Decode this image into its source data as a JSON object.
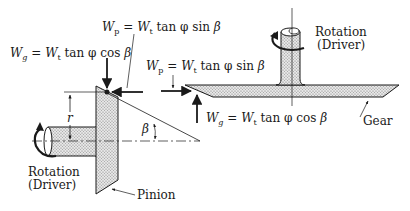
{
  "diagram": {
    "type": "bevel-gear-force-diagram",
    "labels": {
      "wg_left": {
        "lhs": "W",
        "lhs_sub": "g",
        "eq": " = ",
        "rhs": "W",
        "rhs_sub": "t",
        "expr": " tan φ cos ",
        "angle": "β"
      },
      "wp_top": {
        "lhs": "W",
        "lhs_sub": "p",
        "eq": " = ",
        "rhs": "W",
        "rhs_sub": "t",
        "expr": " tan φ sin ",
        "angle": "β"
      },
      "wp_right": {
        "lhs": "W",
        "lhs_sub": "p",
        "eq": " = ",
        "rhs": "W",
        "rhs_sub": "t",
        "expr": " tan φ sin ",
        "angle": "β"
      },
      "wg_right": {
        "lhs": "W",
        "lhs_sub": "g",
        "eq": " = ",
        "rhs": "W",
        "rhs_sub": "t",
        "expr": " tan φ cos ",
        "angle": "β"
      },
      "r": "r",
      "beta": "β",
      "rotation_left_1": "Rotation",
      "rotation_left_2": "(Driver)",
      "rotation_right_1": "Rotation",
      "rotation_right_2": "(Driver)",
      "pinion": "Pinion",
      "gear": "Gear"
    },
    "colors": {
      "stroke": "#1a1a1a",
      "fill_hatch": "#d8d8d8",
      "background": "#ffffff"
    }
  }
}
